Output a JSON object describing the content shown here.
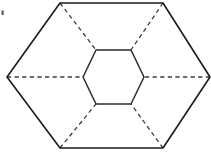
{
  "figure": {
    "canvas": {
      "width": 211,
      "height": 153
    },
    "background_color": "#ffffff",
    "solid_stroke_color": "#1b1b1f",
    "hidden_stroke_color": "#3b3b42",
    "solid_stroke_width": 1.6,
    "hidden_stroke_width": 1.3,
    "hidden_dash_pattern": "4.2 3.4"
  },
  "outer_hexagon": {
    "name": "outer-hexagon",
    "style": "solid",
    "points": "7,77 60,3 163,3 210,77 163,148 60,148",
    "vertices": [
      {
        "label": "left",
        "x": 7,
        "y": 77
      },
      {
        "label": "top-left",
        "x": 60,
        "y": 3
      },
      {
        "label": "top-right",
        "x": 163,
        "y": 3
      },
      {
        "label": "right",
        "x": 210,
        "y": 77
      },
      {
        "label": "bottom-right",
        "x": 163,
        "y": 148
      },
      {
        "label": "bottom-left",
        "x": 60,
        "y": 148
      }
    ]
  },
  "inner_hexagon": {
    "name": "inner-hexagon",
    "style": "solid",
    "points": "83,77 96,50 131,50 144,77 131,104 96,104",
    "vertices": [
      {
        "label": "left",
        "x": 83,
        "y": 77
      },
      {
        "label": "top-left",
        "x": 96,
        "y": 50
      },
      {
        "label": "top-right",
        "x": 131,
        "y": 50
      },
      {
        "label": "right",
        "x": 144,
        "y": 77
      },
      {
        "label": "bottom-right",
        "x": 131,
        "y": 104
      },
      {
        "label": "bottom-left",
        "x": 96,
        "y": 104
      }
    ]
  },
  "connector_edges": [
    {
      "name": "spoke-left",
      "style": "dashed",
      "d": "M 7,77 L 83,77"
    },
    {
      "name": "spoke-top-left",
      "style": "dashed",
      "d": "M 60,3 L 96,50"
    },
    {
      "name": "spoke-top-right",
      "style": "dashed",
      "d": "M 163,3 L 131,50"
    },
    {
      "name": "spoke-right",
      "style": "dashed",
      "d": "M 210,77 L 144,77"
    },
    {
      "name": "spoke-bottom-right",
      "style": "dashed",
      "d": "M 163,148 L 131,104"
    },
    {
      "name": "spoke-bottom-left",
      "style": "dashed",
      "d": "M 60,148 L 96,104"
    }
  ],
  "artifacts": [
    {
      "name": "scan-speck",
      "x": 1.5,
      "y": 10.5,
      "width": 2.2,
      "height": 4.5
    }
  ]
}
